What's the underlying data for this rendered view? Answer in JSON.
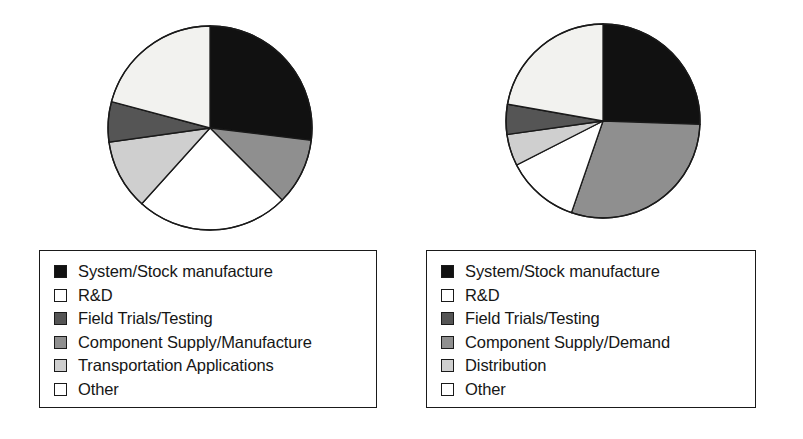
{
  "figure": {
    "background_color": "#ffffff",
    "outline_color": "#1a1a1a"
  },
  "palette": {
    "black": "#111111",
    "white": "#ffffff",
    "cream": "#f2f2ef",
    "dark_gray": "#555555",
    "medium_gray": "#8f8f8f",
    "light_gray": "#cfcfcf"
  },
  "panels": [
    {
      "id": "left",
      "legend": {
        "items": [
          {
            "label": "System/Stock manufacture",
            "color": "#111111"
          },
          {
            "label": "R&D",
            "color": "#ffffff"
          },
          {
            "label": "Field Trials/Testing",
            "color": "#555555"
          },
          {
            "label": "Component Supply/Manufacture",
            "color": "#8f8f8f"
          },
          {
            "label": "Transportation Applications",
            "color": "#cfcfcf"
          },
          {
            "label": "Other",
            "color": "#ffffff"
          }
        ]
      }
    },
    {
      "id": "right",
      "legend": {
        "items": [
          {
            "label": "System/Stock manufacture",
            "color": "#111111"
          },
          {
            "label": "R&D",
            "color": "#ffffff"
          },
          {
            "label": "Field Trials/Testing",
            "color": "#555555"
          },
          {
            "label": "Component Supply/Demand",
            "color": "#8f8f8f"
          },
          {
            "label": "Distribution",
            "color": "#cfcfcf"
          },
          {
            "label": "Other",
            "color": "#ffffff"
          }
        ]
      }
    }
  ],
  "chart_data": [
    {
      "type": "pie",
      "id": "left-pie",
      "title": "",
      "start_angle_deg": 0,
      "direction": "clockwise",
      "radius_px": 102,
      "center_px": [
        210,
        127
      ],
      "labels": [
        "System/Stock manufacture",
        "Component Supply/Manufacture",
        "Other",
        "Transportation Applications",
        "Field Trials/Testing",
        "R&D"
      ],
      "values": [
        27.0,
        10.5,
        24.0,
        11.0,
        6.5,
        21.0
      ],
      "colors": [
        "#111111",
        "#8f8f8f",
        "#ffffff",
        "#cfcfcf",
        "#555555",
        "#f2f2ef"
      ],
      "angles_deg": [
        [
          0,
          97
        ],
        [
          97,
          135
        ],
        [
          135,
          222
        ],
        [
          222,
          262
        ],
        [
          262,
          285
        ],
        [
          285,
          360
        ]
      ]
    },
    {
      "type": "pie",
      "id": "right-pie",
      "title": "",
      "start_angle_deg": 0,
      "direction": "clockwise",
      "radius_px": 97,
      "center_px": [
        605,
        130
      ],
      "labels": [
        "System/Stock manufacture",
        "Component Supply/Demand",
        "Other",
        "Distribution",
        "Field Trials/Testing",
        "R&D"
      ],
      "values": [
        25.5,
        29.7,
        12.2,
        5.3,
        5.0,
        22.3
      ],
      "colors": [
        "#111111",
        "#8f8f8f",
        "#ffffff",
        "#cfcfcf",
        "#555555",
        "#f2f2ef"
      ],
      "angles_deg": [
        [
          0,
          92
        ],
        [
          92,
          199
        ],
        [
          199,
          243
        ],
        [
          243,
          262
        ],
        [
          262,
          280
        ],
        [
          280,
          360
        ]
      ]
    }
  ]
}
